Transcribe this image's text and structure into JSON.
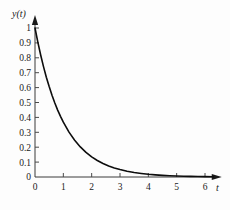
{
  "figure": {
    "background_color": "#fdfdfd",
    "curve_color": "#0d0d0d",
    "axis_color": "#3a3a3a"
  },
  "chart_data": {
    "type": "line",
    "title": "",
    "xlabel": "t",
    "ylabel": "y(t)",
    "xlim": [
      0,
      6.45
    ],
    "ylim": [
      0,
      1.06
    ],
    "grid": false,
    "legend": null,
    "function": "y(t) = e^(-t)",
    "xticks": [
      0,
      1,
      2,
      3,
      4,
      5,
      6
    ],
    "xticklabels": [
      "0",
      "1",
      "2",
      "3",
      "4",
      "5",
      "6"
    ],
    "yticks": [
      0,
      0.1,
      0.2,
      0.3,
      0.4,
      0.5,
      0.6,
      0.7,
      0.8,
      0.9,
      1
    ],
    "yticklabels": [
      "0",
      "0.1",
      "0.2",
      "0.3",
      "0.4",
      "0.5",
      "0.6",
      "0.7",
      "0.8",
      "0.9",
      "1"
    ],
    "series": [
      {
        "name": "y(t) = e^(-t)",
        "x": [
          0,
          0.1,
          0.2,
          0.3,
          0.4,
          0.5,
          0.6,
          0.7,
          0.8,
          0.9,
          1,
          1.2,
          1.4,
          1.6,
          1.8,
          2,
          2.2,
          2.4,
          2.6,
          2.8,
          3,
          3.25,
          3.5,
          3.75,
          4,
          4.25,
          4.5,
          4.75,
          5,
          5.25,
          5.5,
          5.75,
          6,
          6.3
        ],
        "values": [
          1,
          0.905,
          0.819,
          0.741,
          0.67,
          0.607,
          0.549,
          0.497,
          0.449,
          0.407,
          0.368,
          0.301,
          0.247,
          0.202,
          0.165,
          0.135,
          0.111,
          0.091,
          0.074,
          0.061,
          0.05,
          0.039,
          0.03,
          0.024,
          0.018,
          0.014,
          0.011,
          0.0087,
          0.0067,
          0.0052,
          0.0041,
          0.0032,
          0.0025,
          0.0018
        ]
      }
    ]
  }
}
